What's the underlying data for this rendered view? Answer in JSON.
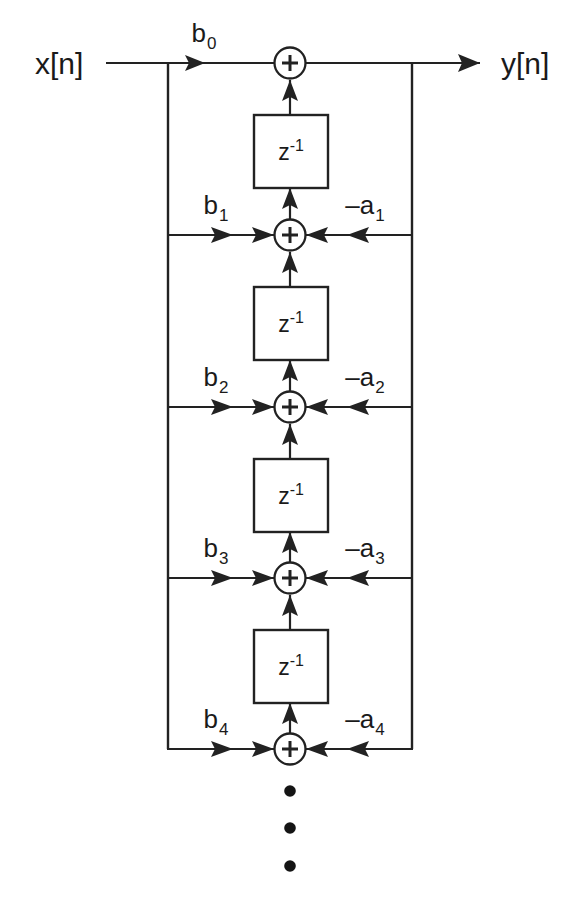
{
  "diagram": {
    "type": "signal-flow-graph",
    "background_color": "#ffffff",
    "line_color": "#222222",
    "io": {
      "input_label": "x[n]",
      "output_label": "y[n]"
    },
    "delay_block": {
      "base": "z",
      "exponent": "-1",
      "count": 4
    },
    "ellipsis": {
      "dot_count": 3,
      "meaning": "pattern continues"
    },
    "stages": [
      {
        "index": 0,
        "feedforward_label": "b",
        "feedforward_sub": "0",
        "feedback_label": "",
        "feedback_sub": "",
        "has_feedback": false,
        "has_delay_below": true,
        "adder_symbol": "+"
      },
      {
        "index": 1,
        "feedforward_label": "b",
        "feedforward_sub": "1",
        "feedback_label": "–a",
        "feedback_sub": "1",
        "has_feedback": true,
        "has_delay_below": true,
        "adder_symbol": "+"
      },
      {
        "index": 2,
        "feedforward_label": "b",
        "feedforward_sub": "2",
        "feedback_label": "–a",
        "feedback_sub": "2",
        "has_feedback": true,
        "has_delay_below": true,
        "adder_symbol": "+"
      },
      {
        "index": 3,
        "feedforward_label": "b",
        "feedforward_sub": "3",
        "feedback_label": "–a",
        "feedback_sub": "3",
        "has_feedback": true,
        "has_delay_below": true,
        "adder_symbol": "+"
      },
      {
        "index": 4,
        "feedforward_label": "b",
        "feedforward_sub": "4",
        "feedback_label": "–a",
        "feedback_sub": "4",
        "has_feedback": true,
        "has_delay_below": false,
        "adder_symbol": "+"
      }
    ]
  }
}
